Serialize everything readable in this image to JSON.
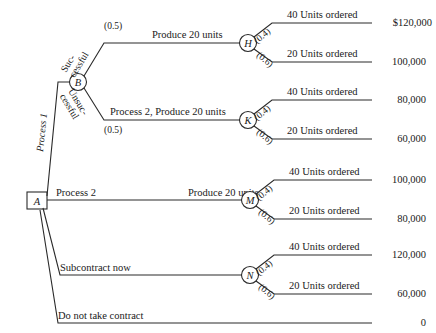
{
  "diagram": {
    "nodes": {
      "a": "A",
      "b": "B",
      "h": "H",
      "k": "K",
      "m": "M",
      "n": "N"
    },
    "root_branches": [
      {
        "id": "process-1",
        "label": "Process 1"
      },
      {
        "id": "process-2",
        "label": "Process 2"
      },
      {
        "id": "subcontract-now",
        "label": "Subcontract now"
      },
      {
        "id": "do-not-take-contract",
        "label": "Do not take contract"
      }
    ],
    "b_branches": [
      {
        "id": "successful",
        "label_line1": "Suc-",
        "label_line2": "cessful",
        "prob": "(0.5)"
      },
      {
        "id": "unsuccessful",
        "label_line1": "Unsuc-",
        "label_line2": "cessful",
        "prob": "(0.5)"
      }
    ],
    "mid_labels": {
      "produce_20_top": "Produce 20 units",
      "process2_produce_20": "Process 2, Produce 20 units",
      "produce_20_mid": "Produce 20 units"
    },
    "demand_branches": [
      {
        "id": "h-40",
        "label": "40 Units ordered",
        "prob": "(0.4)",
        "payoff": "$120,000"
      },
      {
        "id": "h-20",
        "label": "20 Units ordered",
        "prob": "(0.6)",
        "payoff": "100,000"
      },
      {
        "id": "k-40",
        "label": "40 Units ordered",
        "prob": "(0.4)",
        "payoff": "80,000"
      },
      {
        "id": "k-20",
        "label": "20 Units ordered",
        "prob": "(0.6)",
        "payoff": "60,000"
      },
      {
        "id": "m-40",
        "label": "40 Units ordered",
        "prob": "(0.4)",
        "payoff": "100,000"
      },
      {
        "id": "m-20",
        "label": "20 Units ordered",
        "prob": "(0.6)",
        "payoff": "80,000"
      },
      {
        "id": "n-40",
        "label": "40 Units ordered",
        "prob": "(0.4)",
        "payoff": "120,000"
      },
      {
        "id": "n-20",
        "label": "20 Units ordered",
        "prob": "(0.6)",
        "payoff": "60,000"
      }
    ],
    "terminal_payoffs": {
      "do_not_take_contract": "0"
    },
    "colors": {
      "line": "#2a2a2a",
      "text": "#1a1a1a",
      "background": "#ffffff"
    }
  }
}
